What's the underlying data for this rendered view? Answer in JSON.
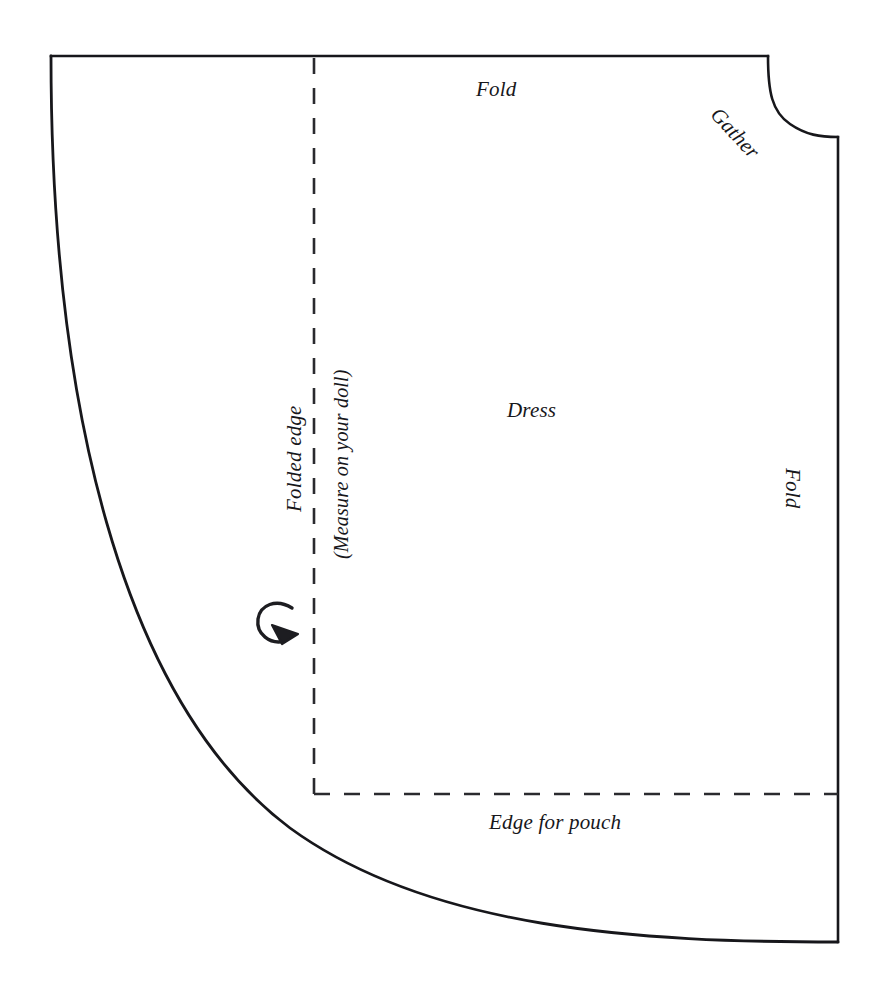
{
  "document": {
    "type": "sewing-pattern-diagram",
    "title": "Dress pattern piece",
    "background_color": "#ffffff",
    "line_color": "#17171b"
  },
  "labels": {
    "fold_top": "Fold",
    "gather": "Gather",
    "folded_edge": "Folded edge",
    "measure_note": "(Measure on your doll)",
    "dress": "Dress",
    "fold_right": "Fold",
    "edge_for_pouch": "Edge for pouch"
  },
  "markings": {
    "fold_arrow": "curved-fold-arrow",
    "vertical_fold_line_style": "dashed",
    "horizontal_pouch_line_style": "dashed",
    "outline_style": "solid"
  },
  "geometry": {
    "outline_top_left": [
      51,
      56
    ],
    "outline_top_right_notch_start": [
      768,
      56
    ],
    "outline_right_edge_x": 838,
    "outline_right_edge_top_y": 137,
    "outline_bottom_right": [
      838,
      942
    ],
    "dashed_vertical_x": 314,
    "dashed_horizontal_y": 794
  }
}
